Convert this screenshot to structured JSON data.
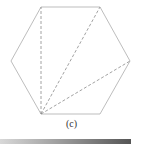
{
  "figure": {
    "caption": "(c)",
    "shape": "regular-hexagon",
    "vertices": [
      [
        41,
        7
      ],
      [
        100,
        7
      ],
      [
        130,
        61
      ],
      [
        100,
        114
      ],
      [
        41,
        114
      ],
      [
        11,
        61
      ]
    ],
    "diagonals_from_vertex": [
      41,
      114
    ],
    "diagonal_targets": [
      [
        41,
        7
      ],
      [
        100,
        7
      ],
      [
        130,
        61
      ]
    ],
    "stroke_color": "#b0b0b0",
    "dash_color": "#8a8a8a"
  }
}
